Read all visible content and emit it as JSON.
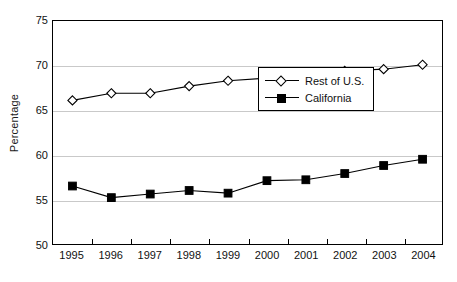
{
  "chart_data": {
    "type": "line",
    "title": "",
    "xlabel": "",
    "ylabel": "Percentage",
    "ylim": [
      50,
      75
    ],
    "yticks": [
      50,
      55,
      60,
      65,
      70,
      75
    ],
    "grid": "horizontal",
    "legend_position": "center-right",
    "categories": [
      "1995",
      "1996",
      "1997",
      "1998",
      "1999",
      "2000",
      "2001",
      "2002",
      "2003",
      "2004"
    ],
    "series": [
      {
        "name": "Rest of U.S.",
        "marker": "open-diamond",
        "color": "#000000",
        "values": [
          66.1,
          66.9,
          66.9,
          67.7,
          68.3,
          68.6,
          69.2,
          69.4,
          69.6,
          70.1
        ]
      },
      {
        "name": "California",
        "marker": "filled-square",
        "color": "#000000",
        "values": [
          56.5,
          55.2,
          55.6,
          56.0,
          55.7,
          57.1,
          57.2,
          57.9,
          58.8,
          59.5
        ]
      }
    ]
  },
  "legend": {
    "items": [
      {
        "label": "Rest of U.S."
      },
      {
        "label": "California"
      }
    ]
  }
}
